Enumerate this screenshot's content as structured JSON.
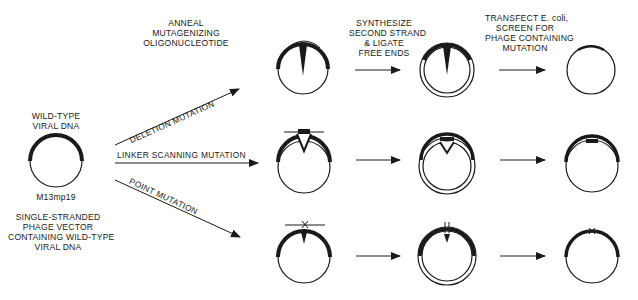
{
  "diagram": {
    "steps": {
      "anneal": [
        "ANNEAL",
        "MUTAGENIZING",
        "OLIGONUCLEOTIDE"
      ],
      "synthesize": [
        "SYNTHESIZE",
        "SECOND STRAND",
        "& LIGATE",
        "FREE ENDS"
      ],
      "transfect": [
        "TRANSFECT E. coli,",
        "SCREEN FOR",
        "PHAGE CONTAINING",
        "MUTATION"
      ]
    },
    "start": {
      "top_label": [
        "WILD-TYPE",
        "VIRAL DNA"
      ],
      "vector_name": "M13mp19",
      "caption": [
        "SINGLE-STRANDED",
        "PHAGE VECTOR",
        "CONTAINING WILD-TYPE",
        "VIRAL DNA"
      ]
    },
    "branches": [
      {
        "label": "DELETION MUTATION",
        "marker": "deletion-loop"
      },
      {
        "label": "LINKER SCANNING MUTATION",
        "marker": "linker-insert"
      },
      {
        "label": "POINT MUTATION",
        "marker": "point-x"
      }
    ],
    "colors": {
      "ink": "#1a1a1a",
      "background": "#ffffff"
    }
  }
}
